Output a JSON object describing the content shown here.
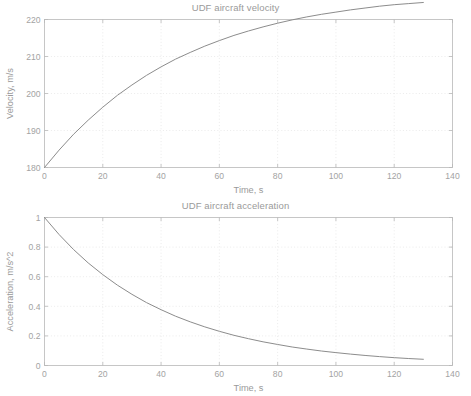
{
  "figure": {
    "name": "UDF aircraft performance figure",
    "background_color": "#ffffff",
    "axis_color": "#b9b9b9",
    "grid_color": "#e2e2e2",
    "curve_color": "#8c8c8c",
    "text_color": "#9a9a9a"
  },
  "panels": [
    {
      "id": "velocity",
      "title": "UDF aircraft velocity",
      "xlabel": "Time, s",
      "ylabel": "Velocity, m/s",
      "xticks": [
        "0",
        "20",
        "40",
        "60",
        "80",
        "100",
        "120",
        "140"
      ],
      "yticks": [
        "180",
        "190",
        "200",
        "210",
        "220"
      ]
    },
    {
      "id": "acceleration",
      "title": "UDF aircraft acceleration",
      "xlabel": "Time, s",
      "ylabel": "Acceleration, m/s^2",
      "xticks": [
        "0",
        "20",
        "40",
        "60",
        "80",
        "100",
        "120",
        "140"
      ],
      "yticks": [
        "0",
        "0.2",
        "0.4",
        "0.6",
        "0.8",
        "1"
      ]
    }
  ],
  "chart_data": [
    {
      "type": "line",
      "id": "velocity",
      "title": "UDF aircraft velocity",
      "xlabel": "Time, s",
      "ylabel": "Velocity, m/s",
      "xlim": [
        0,
        140
      ],
      "ylim": [
        180,
        220
      ],
      "xticks": [
        0,
        20,
        40,
        60,
        80,
        100,
        120,
        140
      ],
      "yticks": [
        180,
        190,
        200,
        210,
        220
      ],
      "grid": true,
      "legend": null,
      "series": [
        {
          "name": "velocity",
          "color": "#8c8c8c",
          "x": [
            0,
            5,
            10,
            15,
            20,
            25,
            30,
            35,
            40,
            45,
            50,
            55,
            60,
            65,
            70,
            75,
            80,
            85,
            90,
            95,
            100,
            105,
            110,
            115,
            120,
            125,
            130
          ],
          "values": [
            180.0,
            184.7,
            189.0,
            192.8,
            196.3,
            199.5,
            202.3,
            204.9,
            207.2,
            209.3,
            211.1,
            212.8,
            214.3,
            215.7,
            216.9,
            218.0,
            219.0,
            219.9,
            220.7,
            221.4,
            222.0,
            222.6,
            223.1,
            223.6,
            224.0,
            224.3,
            224.6
          ]
        }
      ]
    },
    {
      "type": "line",
      "id": "acceleration",
      "title": "UDF aircraft acceleration",
      "xlabel": "Time, s",
      "ylabel": "Acceleration, m/s^2",
      "xlim": [
        0,
        140
      ],
      "ylim": [
        0,
        1
      ],
      "xticks": [
        0,
        20,
        40,
        60,
        80,
        100,
        120,
        140
      ],
      "yticks": [
        0,
        0.2,
        0.4,
        0.6,
        0.8,
        1
      ],
      "grid": true,
      "legend": null,
      "series": [
        {
          "name": "acceleration",
          "color": "#8c8c8c",
          "x": [
            0,
            5,
            10,
            15,
            20,
            25,
            30,
            35,
            40,
            45,
            50,
            55,
            60,
            65,
            70,
            75,
            80,
            85,
            90,
            95,
            100,
            105,
            110,
            115,
            120,
            125,
            130
          ],
          "values": [
            1.0,
            0.885,
            0.783,
            0.693,
            0.614,
            0.543,
            0.481,
            0.425,
            0.377,
            0.333,
            0.295,
            0.261,
            0.231,
            0.204,
            0.181,
            0.16,
            0.142,
            0.125,
            0.111,
            0.098,
            0.087,
            0.077,
            0.068,
            0.06,
            0.053,
            0.047,
            0.042
          ]
        }
      ]
    }
  ]
}
